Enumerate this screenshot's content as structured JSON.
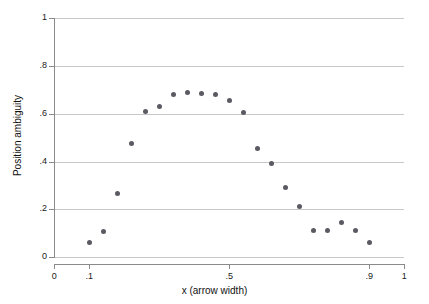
{
  "chart_data": {
    "type": "scatter",
    "title": "",
    "xlabel": "x (arrow width)",
    "ylabel": "Position ambiguity",
    "xlim": [
      0,
      1
    ],
    "ylim": [
      0,
      1
    ],
    "grid": "horizontal",
    "legend": "none",
    "marker_color": "#5a5a62",
    "grid_color": "#c8c8c8",
    "axis_color": "#8a8a8a",
    "xticks": [
      {
        "value": 0,
        "label": "0"
      },
      {
        "value": 0.1,
        "label": ".1"
      },
      {
        "value": 0.5,
        "label": ".5"
      },
      {
        "value": 0.9,
        "label": ".9"
      },
      {
        "value": 1,
        "label": "1"
      }
    ],
    "yticks": [
      {
        "value": 0,
        "label": "0"
      },
      {
        "value": 0.2,
        "label": ".2"
      },
      {
        "value": 0.4,
        "label": ".4"
      },
      {
        "value": 0.6,
        "label": ".6"
      },
      {
        "value": 0.8,
        "label": ".8"
      },
      {
        "value": 1,
        "label": "1"
      }
    ],
    "x": [
      0.1,
      0.14,
      0.18,
      0.22,
      0.26,
      0.3,
      0.34,
      0.38,
      0.42,
      0.46,
      0.5,
      0.54,
      0.58,
      0.62,
      0.66,
      0.7,
      0.74,
      0.78,
      0.82,
      0.86,
      0.9
    ],
    "y": [
      0.061,
      0.109,
      0.265,
      0.476,
      0.61,
      0.632,
      0.679,
      0.69,
      0.684,
      0.682,
      0.655,
      0.607,
      0.455,
      0.393,
      0.293,
      0.212,
      0.11,
      0.11,
      0.147,
      0.11,
      0.062
    ]
  }
}
